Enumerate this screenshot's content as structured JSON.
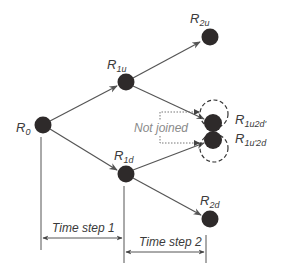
{
  "diagram": {
    "type": "binomial-tree",
    "colors": {
      "node": "#2e2a2a",
      "edge": "#555555",
      "note": "#8a8a8a",
      "dashed": "#333333"
    },
    "nodes": [
      {
        "id": "R0",
        "base": "R",
        "sub": "0"
      },
      {
        "id": "R1u",
        "base": "R",
        "sub": "1u"
      },
      {
        "id": "R1d",
        "base": "R",
        "sub": "1d"
      },
      {
        "id": "R2u",
        "base": "R",
        "sub": "2u"
      },
      {
        "id": "R1u2d'",
        "base": "R",
        "sub": "1u2d'"
      },
      {
        "id": "R1u'2d",
        "base": "R",
        "sub": "1u'2d"
      },
      {
        "id": "R2d",
        "base": "R",
        "sub": "2d"
      }
    ],
    "edges": [
      [
        "R0",
        "R1u"
      ],
      [
        "R0",
        "R1d"
      ],
      [
        "R1u",
        "R2u"
      ],
      [
        "R1u",
        "R1u2d'"
      ],
      [
        "R1d",
        "R1u'2d"
      ],
      [
        "R1d",
        "R2d"
      ]
    ],
    "annotation": "Not joined",
    "time_steps": [
      {
        "label": "Time step 1"
      },
      {
        "label": "Time step 2"
      }
    ]
  }
}
